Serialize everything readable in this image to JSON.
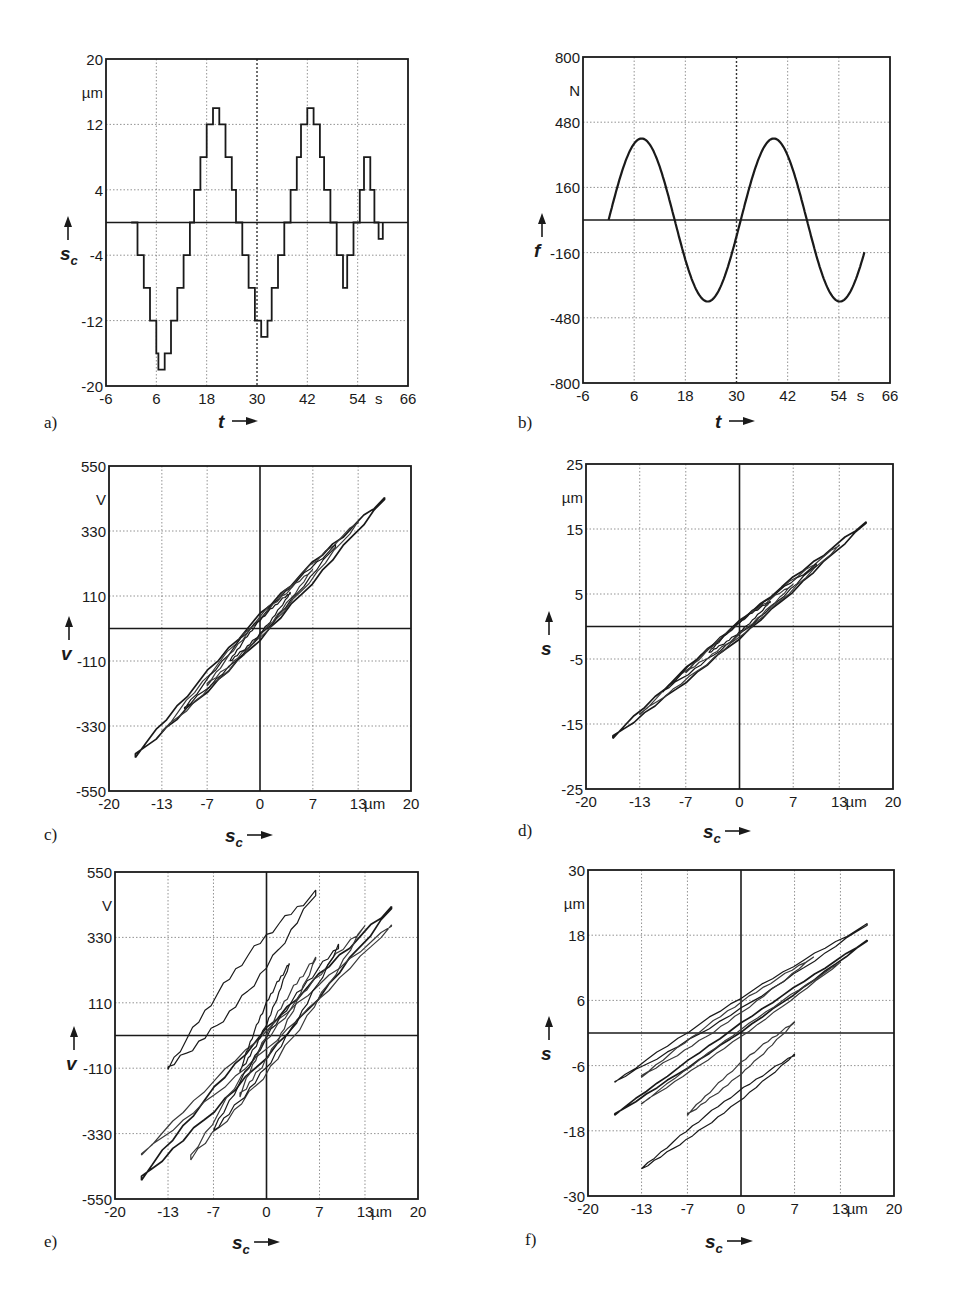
{
  "figure": {
    "background": "#ffffff",
    "ink": "#1a1a1a",
    "grid_color": "#777777"
  },
  "chart_data": [
    {
      "id": "a",
      "panel_label": "a)",
      "type": "line",
      "title": "",
      "xlabel": "t",
      "x_unit": "s",
      "ylabel": "s_c",
      "y_unit": "µm",
      "xlim": [
        -6,
        66
      ],
      "ylim": [
        -20,
        20
      ],
      "xticks": [
        -6,
        6,
        18,
        30,
        42,
        54,
        66
      ],
      "yticks": [
        -20,
        -12,
        -4,
        4,
        12,
        20
      ],
      "grid": true,
      "zero_line": "horizontal",
      "dotted_reference_x": 30,
      "frame": {
        "x0": 106,
        "y0": 59,
        "x1": 408,
        "y1": 386
      },
      "label_pos": {
        "panel": [
          44,
          428
        ],
        "xlabel": [
          218,
          412
        ],
        "ylabel": [
          64,
          250
        ]
      },
      "series": [
        {
          "name": "commanded displacement s_c (staircase)",
          "style": "step",
          "x": [
            0,
            1.5,
            1.5,
            3,
            3,
            4.5,
            4.5,
            6,
            6,
            6.5,
            6.5,
            8,
            8,
            9.5,
            9.5,
            11,
            11,
            12.5,
            12.5,
            14,
            14,
            15,
            15,
            16.5,
            16.5,
            18,
            18,
            19.5,
            19.5,
            21,
            21,
            22.5,
            22.5,
            24,
            24,
            25,
            25,
            26.5,
            26.5,
            28,
            28,
            29.5,
            29.5,
            31,
            31,
            32.5,
            32.5,
            33.5,
            33.5,
            35,
            35,
            36.5,
            36.5,
            38,
            38,
            39.5,
            39.5,
            40.5,
            40.5,
            42,
            42,
            43.5,
            43.5,
            45,
            45,
            46,
            46,
            47.5,
            47.5,
            49,
            49,
            50.5,
            50.5,
            51.5,
            51.5,
            53,
            53,
            54.5,
            54.5,
            55.5,
            55.5,
            57,
            57,
            58,
            58,
            59,
            59,
            60,
            60
          ],
          "y": [
            0,
            0,
            -4,
            -4,
            -8,
            -8,
            -12,
            -12,
            -16,
            -16,
            -18,
            -18,
            -16,
            -16,
            -12,
            -12,
            -8,
            -8,
            -4,
            -4,
            0,
            0,
            4,
            4,
            8,
            8,
            12,
            12,
            14,
            14,
            12,
            12,
            8,
            8,
            4,
            4,
            0,
            0,
            -4,
            -4,
            -8,
            -8,
            -12,
            -12,
            -14,
            -14,
            -12,
            -12,
            -8,
            -8,
            -4,
            -4,
            0,
            0,
            4,
            4,
            8,
            8,
            12,
            12,
            14,
            14,
            12,
            12,
            8,
            8,
            4,
            4,
            0,
            0,
            -4,
            -4,
            -8,
            -8,
            -4,
            -4,
            0,
            0,
            4,
            4,
            8,
            8,
            4,
            4,
            0,
            0,
            -2,
            -2,
            0,
            0,
            3
          ],
          "peaks": {
            "pos": [
              16,
              13,
              10,
              8,
              4
            ],
            "neg": [
              -18,
              -14,
              -10,
              -7,
              -3
            ]
          }
        }
      ]
    },
    {
      "id": "b",
      "panel_label": "b)",
      "type": "line",
      "title": "",
      "xlabel": "t",
      "x_unit": "s",
      "ylabel": "f",
      "y_unit": "N",
      "xlim": [
        -6,
        66
      ],
      "ylim": [
        -800,
        800
      ],
      "xticks": [
        -6,
        6,
        18,
        30,
        42,
        54,
        66
      ],
      "yticks": [
        -800,
        -480,
        -160,
        160,
        480,
        800
      ],
      "grid": true,
      "zero_line": "horizontal",
      "dotted_reference_x": 30,
      "frame": {
        "x0": 583,
        "y0": 57,
        "x1": 890,
        "y1": 383
      },
      "label_pos": {
        "panel": [
          518,
          428
        ],
        "xlabel": [
          715,
          412
        ],
        "ylabel": [
          538,
          247
        ]
      },
      "series": [
        {
          "name": "applied force f (sinusoid)",
          "style": "smooth",
          "amplitude": 400,
          "period_s": 31,
          "start_s": 0,
          "end_s": 60,
          "x": [
            0,
            4,
            8,
            12,
            16,
            20,
            24,
            28,
            32,
            36,
            40,
            44,
            48,
            52,
            56,
            60
          ],
          "y": [
            0,
            300,
            390,
            250,
            -60,
            -330,
            -400,
            -240,
            60,
            340,
            400,
            220,
            -120,
            -380,
            -380,
            -180
          ]
        }
      ]
    },
    {
      "id": "c",
      "panel_label": "c)",
      "type": "line",
      "title": "",
      "xlabel": "s_c",
      "x_unit": "µm",
      "ylabel": "v",
      "y_unit": "V",
      "xlim": [
        -20,
        20
      ],
      "ylim": [
        -550,
        550
      ],
      "xticks": [
        -20,
        -13,
        -7,
        0,
        7,
        13,
        20
      ],
      "yticks": [
        -550,
        -330,
        -110,
        110,
        330,
        550
      ],
      "grid": true,
      "zero_line": "both",
      "frame": {
        "x0": 109,
        "y0": 466,
        "x1": 411,
        "y1": 791
      },
      "label_pos": {
        "panel": [
          44,
          840
        ],
        "xlabel": [
          225,
          826
        ],
        "ylabel": [
          65,
          650
        ]
      },
      "series": [
        {
          "name": "voltage hysteresis loops",
          "style": "loops",
          "loops": [
            {
              "xmin": -16.5,
              "xmax": 16.5,
              "ymin": -430,
              "ymax": 440,
              "width": 80
            },
            {
              "xmin": -13,
              "xmax": 13,
              "ymin": -350,
              "ymax": 360,
              "width": 70
            },
            {
              "xmin": -10,
              "xmax": 10,
              "ymin": -270,
              "ymax": 280,
              "width": 60
            },
            {
              "xmin": -7,
              "xmax": 7,
              "ymin": -190,
              "ymax": 200,
              "width": 55
            },
            {
              "xmin": -4,
              "xmax": 4,
              "ymin": -110,
              "ymax": 120,
              "width": 45
            }
          ]
        }
      ]
    },
    {
      "id": "d",
      "panel_label": "d)",
      "type": "line",
      "title": "",
      "xlabel": "s_c",
      "x_unit": "µm",
      "ylabel": "s",
      "y_unit": "µm",
      "xlim": [
        -20,
        20
      ],
      "ylim": [
        -25,
        25
      ],
      "xticks": [
        -20,
        -13,
        -7,
        0,
        7,
        13,
        20
      ],
      "yticks": [
        -25,
        -15,
        -5,
        5,
        15,
        25
      ],
      "grid": true,
      "zero_line": "both",
      "frame": {
        "x0": 586,
        "y0": 464,
        "x1": 893,
        "y1": 789
      },
      "label_pos": {
        "panel": [
          518,
          836
        ],
        "xlabel": [
          703,
          822
        ],
        "ylabel": [
          545,
          645
        ]
      },
      "series": [
        {
          "name": "actual displacement loops",
          "style": "loops",
          "loops": [
            {
              "xmin": -16.5,
              "xmax": 16.5,
              "ymin": -17,
              "ymax": 16,
              "width": 2.5
            },
            {
              "xmin": -13,
              "xmax": 13,
              "ymin": -13.5,
              "ymax": 12.5,
              "width": 2.2
            },
            {
              "xmin": -10,
              "xmax": 10,
              "ymin": -10,
              "ymax": 9.5,
              "width": 2
            },
            {
              "xmin": -7,
              "xmax": 7,
              "ymin": -7,
              "ymax": 6.5,
              "width": 1.8
            },
            {
              "xmin": -4,
              "xmax": 4,
              "ymin": -4,
              "ymax": 3.8,
              "width": 1.5
            }
          ]
        }
      ]
    },
    {
      "id": "e",
      "panel_label": "e)",
      "type": "line",
      "title": "",
      "xlabel": "s_c",
      "x_unit": "µm",
      "ylabel": "v",
      "y_unit": "V",
      "xlim": [
        -20,
        20
      ],
      "ylim": [
        -550,
        550
      ],
      "xticks": [
        -20,
        -13,
        -7,
        0,
        7,
        13,
        20
      ],
      "yticks": [
        -550,
        -330,
        -110,
        110,
        330,
        550
      ],
      "grid": true,
      "zero_line": "both",
      "frame": {
        "x0": 115,
        "y0": 872,
        "x1": 418,
        "y1": 1199
      },
      "label_pos": {
        "panel": [
          44,
          1247
        ],
        "xlabel": [
          232,
          1233
        ],
        "ylabel": [
          70,
          1060
        ]
      },
      "series": [
        {
          "name": "voltage loops under load (offset)",
          "style": "loops",
          "loops": [
            {
              "xmin": -16.5,
              "xmax": 16.5,
              "ymin": -480,
              "ymax": 430,
              "width": 90,
              "offset": 0
            },
            {
              "xmin": -16.5,
              "xmax": 16.5,
              "ymin": -400,
              "ymax": 370,
              "width": 60,
              "offset": 0
            },
            {
              "xmin": -13,
              "xmax": 6.5,
              "ymin": -110,
              "ymax": 480,
              "width": 120,
              "offset": 0
            },
            {
              "xmin": -10,
              "xmax": 13,
              "ymin": -410,
              "ymax": 370,
              "width": 110,
              "offset": 0
            },
            {
              "xmin": -7,
              "xmax": 9.5,
              "ymin": -320,
              "ymax": 300,
              "width": 100,
              "offset": 0
            },
            {
              "xmin": -3.5,
              "xmax": 6.5,
              "ymin": -200,
              "ymax": 260,
              "width": 90,
              "offset": 0
            },
            {
              "xmin": -3.5,
              "xmax": 3,
              "ymin": -120,
              "ymax": 240,
              "width": 70,
              "offset": 0
            }
          ]
        }
      ]
    },
    {
      "id": "f",
      "panel_label": "f)",
      "type": "line",
      "title": "",
      "xlabel": "s_c",
      "x_unit": "µm",
      "ylabel": "s",
      "y_unit": "µm",
      "xlim": [
        -20,
        20
      ],
      "ylim": [
        -30,
        30
      ],
      "xticks": [
        -20,
        -13,
        -7,
        0,
        7,
        13,
        20
      ],
      "yticks": [
        -30,
        -18,
        -6,
        6,
        18,
        30
      ],
      "grid": true,
      "zero_line": "both",
      "frame": {
        "x0": 588,
        "y0": 870,
        "x1": 894,
        "y1": 1196
      },
      "label_pos": {
        "panel": [
          525,
          1245
        ],
        "xlabel": [
          705,
          1232
        ],
        "ylabel": [
          545,
          1050
        ]
      },
      "series": [
        {
          "name": "actual displacement loops under load",
          "style": "loops",
          "loops": [
            {
              "xmin": -16.5,
              "xmax": 16.5,
              "ymin": -15,
              "ymax": 17,
              "width": 1.5
            },
            {
              "xmin": -13,
              "xmax": 13,
              "ymin": -13,
              "ymax": 13,
              "width": 1.3
            },
            {
              "xmin": -16.5,
              "xmax": 16.5,
              "ymin": -9,
              "ymax": 20,
              "width": 2,
              "upper_band": true
            },
            {
              "xmin": -13,
              "xmax": 9.5,
              "ymin": -8,
              "ymax": 14,
              "width": 2,
              "upper_band": true
            },
            {
              "xmin": -13,
              "xmax": 7,
              "ymin": -25,
              "ymax": -4,
              "width": 2,
              "lower_band": true
            },
            {
              "xmin": -7,
              "xmax": 7,
              "ymin": -15,
              "ymax": 2,
              "width": 2,
              "lower_band": true
            }
          ]
        }
      ]
    }
  ]
}
